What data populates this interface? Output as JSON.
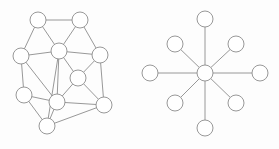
{
  "figure": {
    "background_color": "#fdfdfd",
    "node_fill_color": "#ffffff",
    "node_stroke_color": "#8c8c8c",
    "edge_color": "#8c8c8c",
    "node_radius": 8,
    "stroke_width": 0.9
  },
  "chart_data": {
    "type": "diagram",
    "subtype": "node-link-graph",
    "title": "",
    "xlabel": "",
    "ylabel": "",
    "graphs": [
      {
        "id": "mesh-graph",
        "name": "irregular-mesh-graph",
        "node_count": 10,
        "edge_count": 21,
        "nodes": [
          {
            "id": "n0",
            "label": "",
            "x": 38,
            "y": 20
          },
          {
            "id": "n1",
            "label": "",
            "x": 80,
            "y": 20
          },
          {
            "id": "n2",
            "label": "",
            "x": 21,
            "y": 56
          },
          {
            "id": "n3",
            "label": "",
            "x": 59,
            "y": 51
          },
          {
            "id": "n4",
            "label": "",
            "x": 100,
            "y": 55
          },
          {
            "id": "n5",
            "label": "",
            "x": 78,
            "y": 78
          },
          {
            "id": "n6",
            "label": "",
            "x": 24,
            "y": 95
          },
          {
            "id": "n7",
            "label": "",
            "x": 57,
            "y": 102
          },
          {
            "id": "n8",
            "label": "",
            "x": 104,
            "y": 105
          },
          {
            "id": "n9",
            "label": "",
            "x": 47,
            "y": 126
          }
        ],
        "edges": [
          {
            "from": "n0",
            "to": "n1"
          },
          {
            "from": "n0",
            "to": "n2"
          },
          {
            "from": "n0",
            "to": "n3"
          },
          {
            "from": "n1",
            "to": "n3"
          },
          {
            "from": "n1",
            "to": "n4"
          },
          {
            "from": "n2",
            "to": "n3"
          },
          {
            "from": "n2",
            "to": "n6"
          },
          {
            "from": "n2",
            "to": "n7"
          },
          {
            "from": "n3",
            "to": "n4"
          },
          {
            "from": "n3",
            "to": "n5"
          },
          {
            "from": "n3",
            "to": "n7"
          },
          {
            "from": "n3",
            "to": "n9"
          },
          {
            "from": "n4",
            "to": "n5"
          },
          {
            "from": "n4",
            "to": "n8"
          },
          {
            "from": "n5",
            "to": "n7"
          },
          {
            "from": "n5",
            "to": "n8"
          },
          {
            "from": "n6",
            "to": "n7"
          },
          {
            "from": "n6",
            "to": "n9"
          },
          {
            "from": "n7",
            "to": "n8"
          },
          {
            "from": "n7",
            "to": "n9"
          },
          {
            "from": "n9",
            "to": "n8"
          }
        ]
      },
      {
        "id": "star-graph",
        "name": "star-graph",
        "node_count": 9,
        "edge_count": 8,
        "hub": "s0",
        "nodes": [
          {
            "id": "s0",
            "label": "",
            "x": 205,
            "y": 73,
            "role": "hub"
          },
          {
            "id": "s1",
            "label": "",
            "x": 205,
            "y": 19,
            "role": "leaf"
          },
          {
            "id": "s2",
            "label": "",
            "x": 236,
            "y": 44,
            "role": "leaf"
          },
          {
            "id": "s3",
            "label": "",
            "x": 260,
            "y": 73,
            "role": "leaf"
          },
          {
            "id": "s4",
            "label": "",
            "x": 236,
            "y": 103,
            "role": "leaf"
          },
          {
            "id": "s5",
            "label": "",
            "x": 205,
            "y": 128,
            "role": "leaf"
          },
          {
            "id": "s6",
            "label": "",
            "x": 175,
            "y": 103,
            "role": "leaf"
          },
          {
            "id": "s7",
            "label": "",
            "x": 150,
            "y": 73,
            "role": "leaf"
          },
          {
            "id": "s8",
            "label": "",
            "x": 175,
            "y": 44,
            "role": "leaf"
          }
        ],
        "edges": [
          {
            "from": "s0",
            "to": "s1"
          },
          {
            "from": "s0",
            "to": "s2"
          },
          {
            "from": "s0",
            "to": "s3"
          },
          {
            "from": "s0",
            "to": "s4"
          },
          {
            "from": "s0",
            "to": "s5"
          },
          {
            "from": "s0",
            "to": "s6"
          },
          {
            "from": "s0",
            "to": "s7"
          },
          {
            "from": "s0",
            "to": "s8"
          }
        ]
      }
    ]
  }
}
